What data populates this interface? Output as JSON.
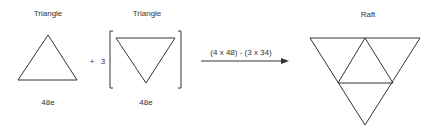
{
  "left_triangle": {
    "title": "Triangle",
    "value": "48e"
  },
  "operator": {
    "plus": "+",
    "multiplier": "3"
  },
  "bracket_triangle": {
    "title": "Triangle",
    "value": "48e"
  },
  "arrow": {
    "label": "(4 x 48) - (3 x 34)"
  },
  "result": {
    "title": "Raft"
  },
  "colors": {
    "stroke": "#333333",
    "background": "#ffffff"
  }
}
